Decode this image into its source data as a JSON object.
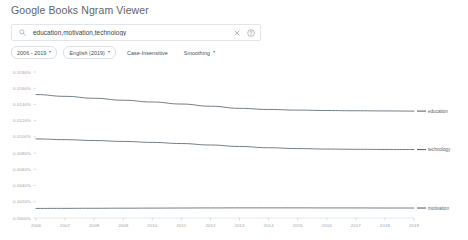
{
  "header": {
    "title": "Google Books Ngram Viewer"
  },
  "search": {
    "value": "education,motivation,technology",
    "placeholder": "Enter comma-separated phrases",
    "search_icon": "search-icon",
    "clear_icon": "close-icon",
    "help_icon": "question-mark-icon"
  },
  "chips": [
    {
      "label": "2006 - 2019",
      "caret": "▾",
      "has_caret": true,
      "bordered": true
    },
    {
      "label": "English (2019)",
      "caret": "▾",
      "has_caret": true,
      "bordered": true
    },
    {
      "label": "Case-Insensitive",
      "caret": "",
      "has_caret": false,
      "bordered": false
    },
    {
      "label": "Smoothing",
      "caret": "▾",
      "has_caret": true,
      "bordered": false
    }
  ],
  "chart_data": {
    "type": "line",
    "title": "",
    "subtitle": "",
    "xlabel": "",
    "ylabel": "",
    "grid": false,
    "legend_position": "right-inline",
    "x": [
      2006,
      2007,
      2008,
      2009,
      2010,
      2011,
      2012,
      2013,
      2014,
      2015,
      2016,
      2017,
      2018,
      2019
    ],
    "xtick_labels": [
      "2006",
      "2007",
      "2008",
      "2009",
      "2010",
      "2011",
      "2012",
      "2013",
      "2014",
      "2015",
      "2016",
      "2017",
      "2018",
      "2019"
    ],
    "xlim": [
      2006,
      2019
    ],
    "ylim": [
      0.0,
      0.018
    ],
    "ytick_values": [
      0.0,
      0.002,
      0.004,
      0.006,
      0.008,
      0.01,
      0.012,
      0.014,
      0.016,
      0.018
    ],
    "ytick_labels": [
      "0.0000%",
      "0.0020%",
      "0.0040%",
      "0.0060%",
      "0.0080%",
      "0.0100%",
      "0.0120%",
      "0.0140%",
      "0.0160%",
      "0.0180%"
    ],
    "series": [
      {
        "name": "education",
        "color": "#5b6770",
        "values": [
          0.01522,
          0.015,
          0.01476,
          0.01452,
          0.0143,
          0.01405,
          0.01378,
          0.01352,
          0.01338,
          0.0133,
          0.01325,
          0.01322,
          0.0132,
          0.01318
        ]
      },
      {
        "name": "technology",
        "color": "#5b6770",
        "values": [
          0.00975,
          0.00966,
          0.00955,
          0.00944,
          0.00932,
          0.00918,
          0.009,
          0.00882,
          0.00866,
          0.00856,
          0.0085,
          0.00847,
          0.00845,
          0.00844
        ]
      },
      {
        "name": "motivation",
        "color": "#5b6770",
        "values": [
          0.00118,
          0.00119,
          0.0012,
          0.00121,
          0.00122,
          0.00123,
          0.00124,
          0.00125,
          0.00125,
          0.00125,
          0.00124,
          0.00124,
          0.00123,
          0.00123
        ]
      }
    ]
  }
}
